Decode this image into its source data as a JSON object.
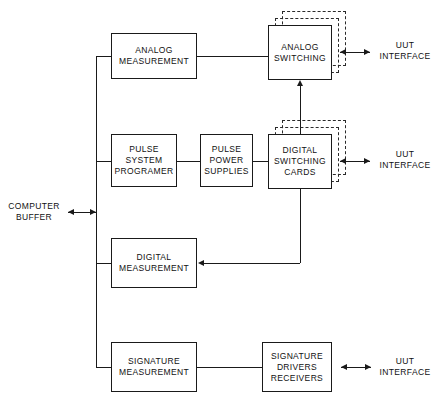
{
  "diagram": {
    "type": "block-diagram",
    "blocks": [
      {
        "id": "analog-measurement",
        "label": "ANALOG\nMEASUREMENT",
        "x": 111,
        "y": 33,
        "w": 86,
        "h": 46,
        "style": "solid"
      },
      {
        "id": "analog-switching",
        "label": "ANALOG\nSWITCHING",
        "x": 268,
        "y": 25,
        "w": 64,
        "h": 55,
        "style": "stacked"
      },
      {
        "id": "pulse-system-programer",
        "label": "PULSE\nSYSTEM\nPROGRAMER",
        "x": 111,
        "y": 134,
        "w": 66,
        "h": 53,
        "style": "solid"
      },
      {
        "id": "pulse-power-supplies",
        "label": "PULSE\nPOWER\nSUPPLIES",
        "x": 200,
        "y": 134,
        "w": 53,
        "h": 53,
        "style": "solid"
      },
      {
        "id": "digital-switching-cards",
        "label": "DIGITAL\nSWITCHING\nCARDS",
        "x": 268,
        "y": 134,
        "w": 64,
        "h": 55,
        "style": "stacked"
      },
      {
        "id": "digital-measurement",
        "label": "DIGITAL\nMEASUREMENT",
        "x": 111,
        "y": 238,
        "w": 86,
        "h": 50,
        "style": "solid"
      },
      {
        "id": "signature-measurement",
        "label": "SIGNATURE\nMEASUREMENT",
        "x": 111,
        "y": 342,
        "w": 86,
        "h": 50,
        "style": "solid"
      },
      {
        "id": "signature-drivers-receivers",
        "label": "SIGNATURE\nDRIVERS\nRECEIVERS",
        "x": 262,
        "y": 342,
        "w": 70,
        "h": 50,
        "style": "solid"
      }
    ],
    "labels": [
      {
        "id": "computer-buffer",
        "text": "COMPUTER\nBUFFER",
        "x": 10,
        "y": 201
      },
      {
        "id": "uut-interface-analog",
        "text": "UUT\nINTERFACE",
        "x": 378,
        "y": 40
      },
      {
        "id": "uut-interface-digital",
        "text": "UUT\nINTERFACE",
        "x": 378,
        "y": 149
      },
      {
        "id": "uut-interface-signature",
        "text": "UUT\nINTERFACE",
        "x": 378,
        "y": 356
      }
    ],
    "bus": {
      "name": "computer-buffer-bus",
      "x": 96,
      "y_top": 56,
      "y_bottom": 367,
      "taps": [
        "analog-measurement",
        "pulse-system-programer",
        "digital-measurement",
        "signature-measurement"
      ]
    },
    "connections": [
      {
        "from": "computer-buffer",
        "to": "computer-buffer-bus",
        "kind": "bidirectional"
      },
      {
        "from": "computer-buffer-bus",
        "to": "analog-measurement",
        "kind": "plain"
      },
      {
        "from": "computer-buffer-bus",
        "to": "pulse-system-programer",
        "kind": "plain"
      },
      {
        "from": "computer-buffer-bus",
        "to": "digital-measurement",
        "kind": "plain"
      },
      {
        "from": "computer-buffer-bus",
        "to": "signature-measurement",
        "kind": "plain"
      },
      {
        "from": "analog-measurement",
        "to": "analog-switching",
        "kind": "plain"
      },
      {
        "from": "pulse-system-programer",
        "to": "pulse-power-supplies",
        "kind": "plain"
      },
      {
        "from": "pulse-power-supplies",
        "to": "digital-switching-cards",
        "kind": "plain"
      },
      {
        "from": "digital-switching-cards",
        "to": "analog-switching",
        "kind": "arrow-up"
      },
      {
        "from": "digital-switching-cards",
        "to": "digital-measurement",
        "kind": "arrow-left"
      },
      {
        "from": "signature-measurement",
        "to": "signature-drivers-receivers",
        "kind": "plain"
      },
      {
        "from": "analog-switching",
        "to": "uut-interface-analog",
        "kind": "bidirectional"
      },
      {
        "from": "digital-switching-cards",
        "to": "uut-interface-digital",
        "kind": "bidirectional"
      },
      {
        "from": "signature-drivers-receivers",
        "to": "uut-interface-signature",
        "kind": "bidirectional"
      }
    ],
    "colors": {
      "line": "#1a1a1a",
      "text": "#111111",
      "background": "#ffffff",
      "dashed": "#2a2a2a"
    }
  }
}
